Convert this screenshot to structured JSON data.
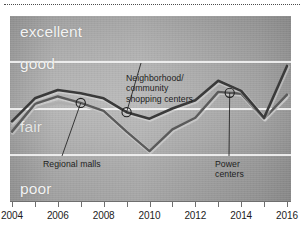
{
  "chart_data": {
    "type": "line",
    "title": "",
    "subtitle": "",
    "xlabel": "",
    "ylabel": "",
    "grid": true,
    "legend_position": "inline-annotations",
    "x": [
      2004,
      2005,
      2006,
      2007,
      2008,
      2009,
      2010,
      2011,
      2012,
      2013,
      2014,
      2015,
      2016
    ],
    "xlim": [
      2004,
      2016
    ],
    "xticks": [
      2004,
      2005,
      2006,
      2007,
      2008,
      2009,
      2010,
      2011,
      2012,
      2013,
      2014,
      2015,
      2016
    ],
    "xticklabels": [
      "2004",
      "",
      "2006",
      "",
      "2008",
      "",
      "2010",
      "",
      "2012",
      "",
      "2014",
      "",
      "2016"
    ],
    "ylabels": [
      "poor",
      "fair",
      "good",
      "excellent"
    ],
    "ylim": [
      0,
      4
    ],
    "yband_boundaries": [
      1,
      2,
      3
    ],
    "series": [
      {
        "name": "Neighborhood/community shopping centers",
        "color": "#3a3a3a",
        "values": [
          1.72,
          2.22,
          2.4,
          2.33,
          2.22,
          1.92,
          1.78,
          2.0,
          2.18,
          2.6,
          2.38,
          1.8,
          2.92
        ]
      },
      {
        "name": "Regional malls",
        "color": "#5a5a5a",
        "values": [
          1.5,
          2.1,
          2.26,
          2.12,
          1.95,
          1.5,
          1.08,
          1.55,
          1.8,
          2.36,
          2.32,
          1.78,
          2.3
        ]
      },
      {
        "name": "Power centers",
        "color": "#aeaeae",
        "values": [
          1.62,
          2.02,
          2.12,
          2.08,
          1.92,
          1.52,
          1.1,
          1.56,
          1.82,
          2.4,
          2.28,
          1.76,
          2.22
        ]
      }
    ],
    "annotations": [
      {
        "id": "neighborhood",
        "lines": [
          "Neighborhood/",
          "community",
          "shopping centers"
        ],
        "target_x": 2009,
        "target_y": 1.92
      },
      {
        "id": "regional",
        "lines": [
          "Regional malls"
        ],
        "target_x": 2007,
        "target_y": 2.12
      },
      {
        "id": "power",
        "lines": [
          "Power",
          "centers"
        ],
        "target_x": 2013.5,
        "target_y": 2.34
      }
    ]
  },
  "bands": {
    "excellent": "excellent",
    "good": "good",
    "fair": "fair",
    "poor": "poor"
  },
  "axis": {
    "ticks": [
      {
        "label": "2004",
        "show": true
      },
      {
        "label": "",
        "show": false
      },
      {
        "label": "2006",
        "show": true
      },
      {
        "label": "",
        "show": false
      },
      {
        "label": "2008",
        "show": true
      },
      {
        "label": "",
        "show": false
      },
      {
        "label": "2010",
        "show": true
      },
      {
        "label": "",
        "show": false
      },
      {
        "label": "2012",
        "show": true
      },
      {
        "label": "",
        "show": false
      },
      {
        "label": "2014",
        "show": true
      },
      {
        "label": "",
        "show": false
      },
      {
        "label": "2016",
        "show": true
      }
    ]
  },
  "annotations": {
    "neighborhood": {
      "line1": "Neighborhood/",
      "line2": "community",
      "line3": "shopping centers"
    },
    "regional": {
      "line1": "Regional malls"
    },
    "power": {
      "line1": "Power",
      "line2": "centers"
    }
  },
  "colors": {
    "series_dark": "#3a3a3a",
    "series_mid": "#5a5a5a",
    "series_light": "#aeaeae",
    "panel_gray": "#a8a8a8",
    "gridline": "#f2f2f2",
    "band_label": "#f4f4f4",
    "axis": "#6f6f6f"
  }
}
